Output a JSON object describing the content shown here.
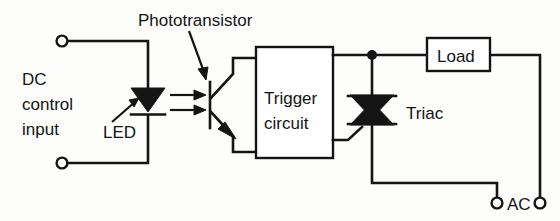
{
  "diagram": {
    "labels": {
      "phototransistor": "Phototransistor",
      "dc_line1": "DC",
      "dc_line2": "control",
      "dc_line3": "input",
      "led": "LED",
      "trigger_line1": "Trigger",
      "trigger_line2": "circuit",
      "triac": "Triac",
      "load": "Load",
      "ac": "AC"
    },
    "components": [
      {
        "name": "input-terminal-top",
        "type": "terminal"
      },
      {
        "name": "input-terminal-bottom",
        "type": "terminal"
      },
      {
        "name": "led",
        "type": "led-diode"
      },
      {
        "name": "phototransistor",
        "type": "phototransistor"
      },
      {
        "name": "trigger-circuit",
        "type": "block"
      },
      {
        "name": "triac",
        "type": "triac"
      },
      {
        "name": "load",
        "type": "block"
      },
      {
        "name": "ac-terminal-left",
        "type": "terminal"
      },
      {
        "name": "ac-terminal-right",
        "type": "terminal"
      }
    ],
    "colors": {
      "ink": "#141414",
      "paper": "#fdfdfc"
    }
  }
}
